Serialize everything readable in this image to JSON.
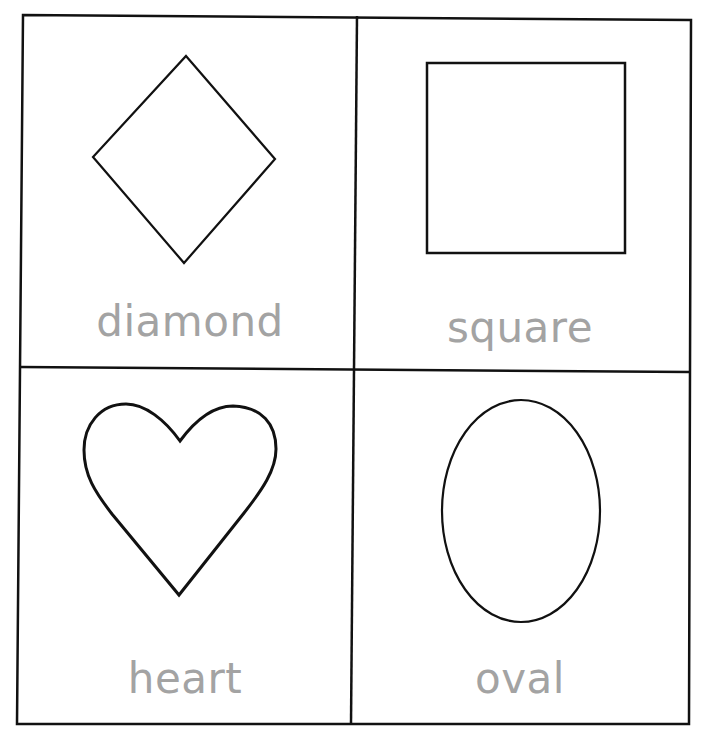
{
  "worksheet": {
    "label_color": "#a3a3a3",
    "line_color": "#111111",
    "cells": [
      {
        "shape": "diamond",
        "label": "diamond"
      },
      {
        "shape": "square",
        "label": "square"
      },
      {
        "shape": "heart",
        "label": "heart"
      },
      {
        "shape": "oval",
        "label": "oval"
      }
    ]
  }
}
